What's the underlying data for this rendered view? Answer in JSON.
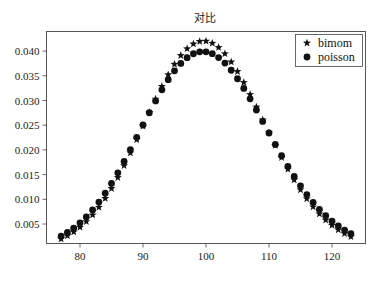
{
  "chart_data": {
    "type": "scatter",
    "title": "对比",
    "xlabel": "",
    "ylabel": "",
    "xlim": [
      75,
      125
    ],
    "ylim": [
      0.0012,
      0.044
    ],
    "grid": false,
    "legend_position": "top-right",
    "xticks": [
      80,
      90,
      100,
      110,
      120
    ],
    "xtick_labels": [
      "80",
      "90",
      "100",
      "110",
      "120"
    ],
    "yticks": [
      0.005,
      0.01,
      0.015,
      0.02,
      0.025,
      0.03,
      0.035,
      0.04
    ],
    "ytick_labels": [
      "0.005",
      "0.010",
      "0.015",
      "0.020",
      "0.025",
      "0.030",
      "0.035",
      "0.040"
    ],
    "x": [
      77,
      78,
      79,
      80,
      81,
      82,
      83,
      84,
      85,
      86,
      87,
      88,
      89,
      90,
      91,
      92,
      93,
      94,
      95,
      96,
      97,
      98,
      99,
      100,
      101,
      102,
      103,
      104,
      105,
      106,
      107,
      108,
      109,
      110,
      111,
      112,
      113,
      114,
      115,
      116,
      117,
      118,
      119,
      120,
      121,
      122,
      123
    ],
    "series": [
      {
        "name": "bimom",
        "marker": "star",
        "color": "#111111",
        "values": [
          0.00199,
          0.00262,
          0.0034,
          0.00435,
          0.00549,
          0.00683,
          0.00839,
          0.01018,
          0.01219,
          0.01441,
          0.01682,
          0.01939,
          0.02208,
          0.02484,
          0.02759,
          0.03029,
          0.03286,
          0.03523,
          0.03733,
          0.03911,
          0.04049,
          0.04146,
          0.04197,
          0.04202,
          0.0416,
          0.04074,
          0.03947,
          0.03782,
          0.03586,
          0.03364,
          0.03123,
          0.02869,
          0.02609,
          0.02348,
          0.02092,
          0.01845,
          0.01611,
          0.01393,
          0.01192,
          0.01011,
          0.00848,
          0.00705,
          0.00581,
          0.00474,
          0.00383,
          0.00307,
          0.00243
        ]
      },
      {
        "name": "poisson",
        "marker": "circle",
        "color": "#111111",
        "values": [
          0.00256,
          0.00329,
          0.00416,
          0.0052,
          0.00642,
          0.00783,
          0.00943,
          0.01122,
          0.01321,
          0.01536,
          0.01765,
          0.02006,
          0.02254,
          0.02504,
          0.02752,
          0.02991,
          0.03216,
          0.03421,
          0.03601,
          0.03751,
          0.03867,
          0.03946,
          0.03986,
          0.03986,
          0.03947,
          0.03869,
          0.03757,
          0.03612,
          0.0344,
          0.03245,
          0.03033,
          0.02808,
          0.02577,
          0.02342,
          0.0211,
          0.01884,
          0.01667,
          0.01463,
          0.01272,
          0.01096,
          0.00937,
          0.00794,
          0.00667,
          0.00556,
          0.0046,
          0.00377,
          0.00306
        ]
      }
    ]
  }
}
